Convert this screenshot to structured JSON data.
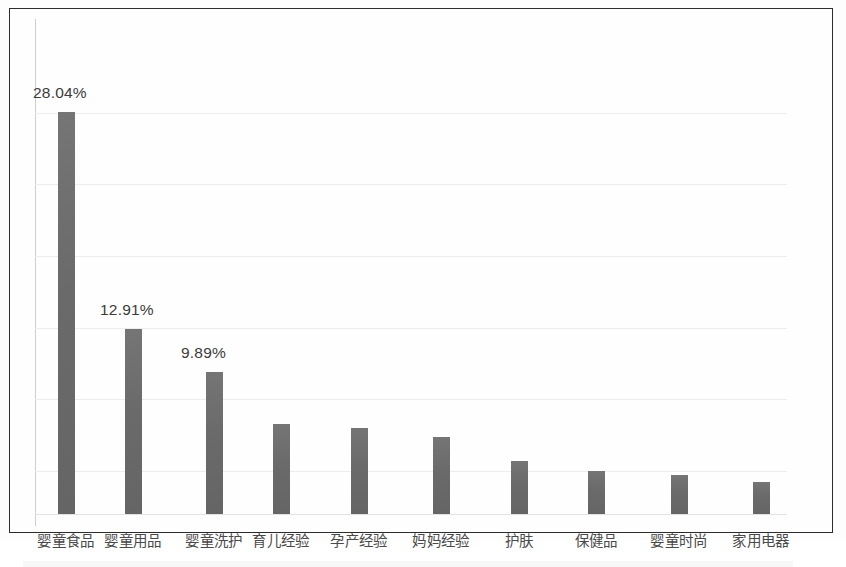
{
  "figure": {
    "background_color": "#fdfdfd",
    "frame_color": "#2c2c2c",
    "bar_color": "#6a6a6a",
    "gridline_color": "#ededed",
    "label_color": "#3b3b3b",
    "category_label_color": "#4a4a4a"
  },
  "chart_data": {
    "type": "bar",
    "title": "",
    "subtitle": "",
    "xlabel": "",
    "ylabel": "",
    "grid": true,
    "legend": false,
    "ylim": [
      0,
      33
    ],
    "categories": [
      "婴童食品",
      "婴童用品",
      "婴童洗护",
      "育儿经验",
      "孕产经验",
      "妈妈经验",
      "护肤",
      "保健品",
      "婴童时尚",
      "家用电器"
    ],
    "values": [
      28.04,
      12.91,
      9.89,
      6.3,
      6.0,
      5.4,
      3.7,
      3.0,
      2.7,
      2.2
    ],
    "data_labels": [
      "28.04%",
      "12.91%",
      "9.89%",
      "",
      "",
      "",
      "",
      "",
      "",
      ""
    ],
    "gridline_values": [
      28.0,
      23.0,
      18.0,
      13.0,
      8.0,
      3.0
    ]
  }
}
